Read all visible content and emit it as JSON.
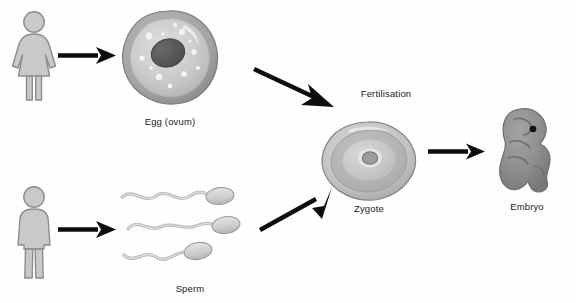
{
  "diagram": {
    "width": 576,
    "height": 303,
    "background": "#fefefe",
    "cut_off_top_text": "",
    "nodes": [
      {
        "id": "female",
        "label": "",
        "kind": "female-pictogram",
        "x": 8,
        "y": 10
      },
      {
        "id": "egg",
        "label": "Egg (ovum)",
        "kind": "egg-cell",
        "x": 118,
        "y": 8
      },
      {
        "id": "male",
        "label": "",
        "kind": "male-pictogram",
        "x": 8,
        "y": 185
      },
      {
        "id": "sperm",
        "label": "Sperm",
        "kind": "sperm-cells",
        "x": 120,
        "y": 185
      },
      {
        "id": "zygote",
        "label": "Zygote",
        "kind": "zygote-cell",
        "x": 318,
        "y": 120
      },
      {
        "id": "embryo",
        "label": "Embryo",
        "kind": "embryo-figure",
        "x": 492,
        "y": 108
      }
    ],
    "labels": {
      "egg": "Egg (ovum)",
      "sperm": "Sperm",
      "fertilisation": "Fertilisation",
      "zygote": "Zygote",
      "embryo": "Embryo"
    },
    "arrows": [
      {
        "id": "female-to-egg",
        "from": "female",
        "to": "egg",
        "direction": "right"
      },
      {
        "id": "male-to-sperm",
        "from": "male",
        "to": "sperm",
        "direction": "right"
      },
      {
        "id": "egg-to-zygote",
        "from": "egg",
        "to": "zygote",
        "direction": "down-right"
      },
      {
        "id": "sperm-to-zygote",
        "from": "sperm",
        "to": "zygote",
        "direction": "up-right"
      },
      {
        "id": "zygote-to-embryo",
        "from": "zygote",
        "to": "embryo",
        "direction": "right"
      }
    ],
    "colors": {
      "arrow": "#0d0d0d",
      "text": "#1b1b1b",
      "pictogram_fill": "#c9c9c9",
      "pictogram_stroke": "#8d8d8d",
      "cell_membrane": "#9a9a9a",
      "cell_cytoplasm": "#cdcdcd",
      "cell_nucleus": "#585858",
      "sperm_fill": "#d2d2d2",
      "sperm_stroke": "#9c9c9c",
      "embryo_fill": "#8e8e8e",
      "embryo_stroke": "#6e6e6e",
      "background": "#fefefe"
    }
  }
}
